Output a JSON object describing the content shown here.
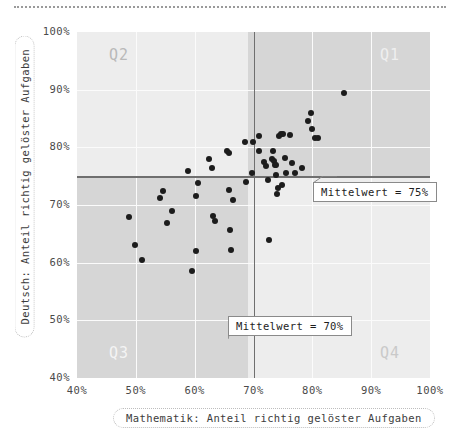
{
  "chart_data": {
    "type": "scatter",
    "title": "",
    "xlabel": "Mathematik: Anteil richtig gelöster Aufgaben",
    "ylabel": "Deutsch: Anteil richtig gelöster Aufgaben",
    "xlim": [
      40,
      100
    ],
    "ylim": [
      40,
      100
    ],
    "xticks": [
      "40%",
      "50%",
      "60%",
      "70%",
      "80%",
      "90%",
      "100%"
    ],
    "xtick_values": [
      40,
      50,
      60,
      70,
      80,
      90,
      100
    ],
    "yticks": [
      "40%",
      "50%",
      "60%",
      "70%",
      "80%",
      "90%",
      "100%"
    ],
    "ytick_values": [
      40,
      50,
      60,
      70,
      80,
      90,
      100
    ],
    "grid": true,
    "legend": "none",
    "quadrants": [
      {
        "name": "Q1",
        "label": "Q1",
        "position": "top-right",
        "fill": "#d6d6d6",
        "text_color": "#efefef"
      },
      {
        "name": "Q2",
        "label": "Q2",
        "position": "top-left",
        "fill": "#ededed",
        "text_color": "#b9b9b9"
      },
      {
        "name": "Q3",
        "label": "Q3",
        "position": "bottom-left",
        "fill": "#d6d6d6",
        "text_color": "#f4f4f4"
      },
      {
        "name": "Q4",
        "label": "Q4",
        "position": "bottom-right",
        "fill": "#ededed",
        "text_color": "#c9c9c9"
      }
    ],
    "reference_lines": [
      {
        "axis": "x",
        "value": 70,
        "label": "Mittelwert = 70%",
        "color": "#6f6f6f"
      },
      {
        "axis": "y",
        "value": 75,
        "label": "Mittelwert = 75%",
        "color": "#6f6f6f"
      }
    ],
    "point_color": "#1c1c1c",
    "points": [
      {
        "x": 48.8,
        "y": 67.9
      },
      {
        "x": 49.9,
        "y": 63.1
      },
      {
        "x": 51.0,
        "y": 60.4
      },
      {
        "x": 54.1,
        "y": 71.3
      },
      {
        "x": 54.6,
        "y": 72.5
      },
      {
        "x": 55.3,
        "y": 66.8
      },
      {
        "x": 56.1,
        "y": 68.9
      },
      {
        "x": 58.8,
        "y": 75.9
      },
      {
        "x": 59.6,
        "y": 58.5
      },
      {
        "x": 60.2,
        "y": 62.0
      },
      {
        "x": 60.3,
        "y": 71.5
      },
      {
        "x": 60.5,
        "y": 73.8
      },
      {
        "x": 62.4,
        "y": 78.0
      },
      {
        "x": 62.9,
        "y": 76.4
      },
      {
        "x": 63.2,
        "y": 68.1
      },
      {
        "x": 63.5,
        "y": 67.2
      },
      {
        "x": 65.5,
        "y": 79.3
      },
      {
        "x": 65.9,
        "y": 79.0
      },
      {
        "x": 65.8,
        "y": 72.6
      },
      {
        "x": 66.0,
        "y": 65.6
      },
      {
        "x": 66.1,
        "y": 62.2
      },
      {
        "x": 66.5,
        "y": 70.9
      },
      {
        "x": 68.5,
        "y": 80.9
      },
      {
        "x": 68.8,
        "y": 74.0
      },
      {
        "x": 69.9,
        "y": 81.0
      },
      {
        "x": 69.8,
        "y": 75.6
      },
      {
        "x": 70.9,
        "y": 79.4
      },
      {
        "x": 71.8,
        "y": 77.4
      },
      {
        "x": 72.2,
        "y": 76.8
      },
      {
        "x": 72.4,
        "y": 74.3
      },
      {
        "x": 72.7,
        "y": 64.0
      },
      {
        "x": 73.2,
        "y": 78.0
      },
      {
        "x": 73.3,
        "y": 79.4
      },
      {
        "x": 73.4,
        "y": 77.7
      },
      {
        "x": 73.6,
        "y": 77.0
      },
      {
        "x": 73.8,
        "y": 76.9
      },
      {
        "x": 73.9,
        "y": 75.2
      },
      {
        "x": 74.0,
        "y": 71.9
      },
      {
        "x": 74.2,
        "y": 72.9
      },
      {
        "x": 74.3,
        "y": 82.0
      },
      {
        "x": 74.6,
        "y": 82.3
      },
      {
        "x": 74.9,
        "y": 73.5
      },
      {
        "x": 75.0,
        "y": 82.3
      },
      {
        "x": 75.4,
        "y": 78.2
      },
      {
        "x": 75.6,
        "y": 75.6
      },
      {
        "x": 76.2,
        "y": 82.1
      },
      {
        "x": 76.5,
        "y": 77.3
      },
      {
        "x": 77.0,
        "y": 75.5
      },
      {
        "x": 78.3,
        "y": 76.5
      },
      {
        "x": 79.2,
        "y": 84.5
      },
      {
        "x": 79.8,
        "y": 85.9
      },
      {
        "x": 80.0,
        "y": 83.2
      },
      {
        "x": 80.4,
        "y": 81.7
      },
      {
        "x": 80.9,
        "y": 81.7
      },
      {
        "x": 85.4,
        "y": 89.5
      },
      {
        "x": 71.0,
        "y": 82.0
      }
    ]
  },
  "axis": {
    "x_title": "Mathematik: Anteil richtig gelöster Aufgaben",
    "y_title": "Deutsch: Anteil richtig gelöster Aufgaben"
  },
  "annotations": {
    "mean_y_label": "Mittelwert = 75%",
    "mean_x_label": "Mittelwert = 70%"
  },
  "quadrant_labels": {
    "q1": "Q1",
    "q2": "Q2",
    "q3": "Q3",
    "q4": "Q4"
  }
}
